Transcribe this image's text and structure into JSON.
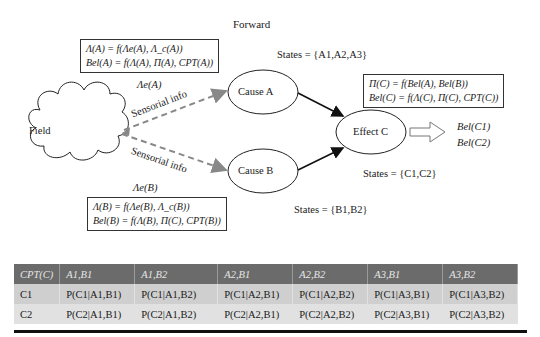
{
  "title": "Forward",
  "nodes": {
    "field": "Field",
    "cause_a": "Cause A",
    "cause_b": "Cause B",
    "effect_c": "Effect C"
  },
  "edges": {
    "sensorial_a": "Sensorial info",
    "sensorial_b": "Sensorial info"
  },
  "labels": {
    "lambda_e_a": "Λe(A)",
    "lambda_e_b": "Λe(B)",
    "states_a": "States = {A1,A2,A3}",
    "states_b": "States = {B1,B2}",
    "states_c": "States = {C1,C2}"
  },
  "formulas": {
    "a": [
      "Λ(A) = f(Λe(A), Λ_c(A))",
      "Bel(A) = f(Λ(A), Π(A), CPT(A))"
    ],
    "b": [
      "Λ(B) = f(Λe(B), Λ_c(B))",
      "Bel(B) = f(Λ(B), Π(C), CPT(B))"
    ],
    "c": [
      "Π(C) = f(Bel(A), Bel(B))",
      "Bel(C) = f(Λ(C), Π(C), CPT(C))"
    ]
  },
  "outputs": [
    "Bel(C1)",
    "Bel(C2)"
  ],
  "cpt_table": {
    "headers": [
      "CPT(C)",
      "A1,B1",
      "A1,B2",
      "A2,B1",
      "A2,B2",
      "A3,B1",
      "A3,B2"
    ],
    "rows": [
      [
        "C1",
        "P(C1|A1,B1)",
        "P(C1|A1,B2)",
        "P(C1|A2,B1)",
        "P(C1|A2,B2)",
        "P(C1|A3,B1)",
        "P(C1|A3,B2)"
      ],
      [
        "C2",
        "P(C2|A1,B1)",
        "P(C2|A1,B2)",
        "P(C2|A2,B1)",
        "P(C2|A2,B2)",
        "P(C2|A3,B1)",
        "P(C2|A3,B2)"
      ]
    ]
  },
  "colors": {
    "header_bg": "#6b6b6b",
    "row1_bg": "#cfcfcf",
    "row2_bg": "#e1e1e1",
    "dashed_arrow": "#8a8a8a"
  }
}
